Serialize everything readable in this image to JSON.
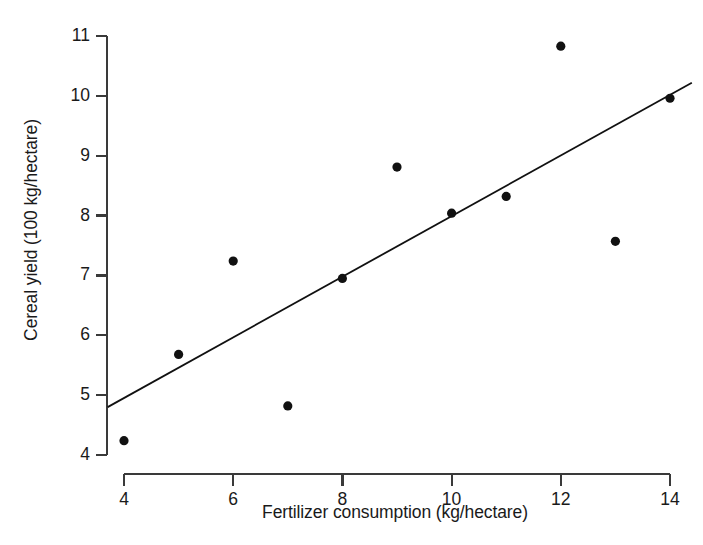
{
  "chart_data": {
    "type": "scatter",
    "title": "",
    "xlabel": "Fertilizer consumption (kg/hectare)",
    "ylabel": "Cereal yield (100 kg/hectare)",
    "xlim": [
      3.65,
      14.45
    ],
    "ylim": [
      3.85,
      11.1
    ],
    "xticks": [
      4,
      6,
      8,
      10,
      12,
      14
    ],
    "xtick_labels": [
      "4",
      "6",
      "8",
      "10",
      "12",
      "14"
    ],
    "yticks": [
      4,
      5,
      6,
      7,
      8,
      9,
      10,
      11
    ],
    "ytick_labels": [
      "4",
      "5",
      "6",
      "7",
      "8",
      "9",
      "10",
      "11"
    ],
    "grid": false,
    "legend": null,
    "x": [
      4,
      5,
      6,
      7,
      8,
      9,
      10,
      11,
      12,
      13,
      14
    ],
    "y": [
      4.24,
      5.68,
      7.24,
      4.82,
      6.95,
      8.81,
      8.04,
      8.32,
      10.83,
      7.57,
      9.96
    ],
    "points": [
      {
        "x": 4,
        "y": 4.24
      },
      {
        "x": 5,
        "y": 5.68
      },
      {
        "x": 6,
        "y": 7.24
      },
      {
        "x": 7,
        "y": 4.82
      },
      {
        "x": 8,
        "y": 6.95
      },
      {
        "x": 9,
        "y": 8.81
      },
      {
        "x": 10,
        "y": 8.04
      },
      {
        "x": 11,
        "y": 8.32
      },
      {
        "x": 12,
        "y": 10.83
      },
      {
        "x": 13,
        "y": 7.57
      },
      {
        "x": 14,
        "y": 9.96
      }
    ],
    "series": [
      {
        "name": "observations",
        "type": "scatter",
        "marker": "filled-circle",
        "color": "#111111",
        "values": [
          4.24,
          5.68,
          7.24,
          4.82,
          6.95,
          8.81,
          8.04,
          8.32,
          10.83,
          7.57,
          9.96
        ]
      },
      {
        "name": "trend-line",
        "type": "line",
        "color": "#111111",
        "endpoints": [
          {
            "x": 3.7,
            "y": 4.8
          },
          {
            "x": 14.4,
            "y": 10.22
          }
        ],
        "slope": 0.506,
        "intercept": 2.93
      }
    ],
    "axis_color": "#3a3a3a",
    "marker_color": "#111111",
    "line_color": "#111111",
    "background": "#ffffff"
  },
  "axes": {
    "y_label": "Cereal yield (100 kg/hectare)",
    "x_label": "Fertilizer consumption (kg/hectare)"
  }
}
